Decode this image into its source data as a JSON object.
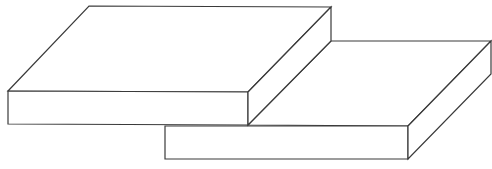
{
  "diagram": {
    "canvas": {
      "width": 492,
      "height": 169,
      "background": "#ffffff"
    },
    "stroke_color": "#3a3a3a",
    "fill_color": "#ffffff",
    "shapes": [
      {
        "id": "slab-lower-right",
        "faces": [
          {
            "name": "top-face",
            "points": "248,125 331,41 491,41 408,126"
          },
          {
            "name": "front-face",
            "points": "165,126 408,126 408,159 165,159"
          },
          {
            "name": "side-face",
            "points": "408,126 491,41 491,74 408,159"
          }
        ]
      },
      {
        "id": "slab-upper-left",
        "faces": [
          {
            "name": "top-face",
            "points": "8,91 89,6 331,7 248,92"
          },
          {
            "name": "front-face",
            "points": "8,91 248,92 248,125 8,124"
          },
          {
            "name": "side-face",
            "points": "248,92 331,7 331,41 248,125"
          }
        ]
      }
    ]
  }
}
